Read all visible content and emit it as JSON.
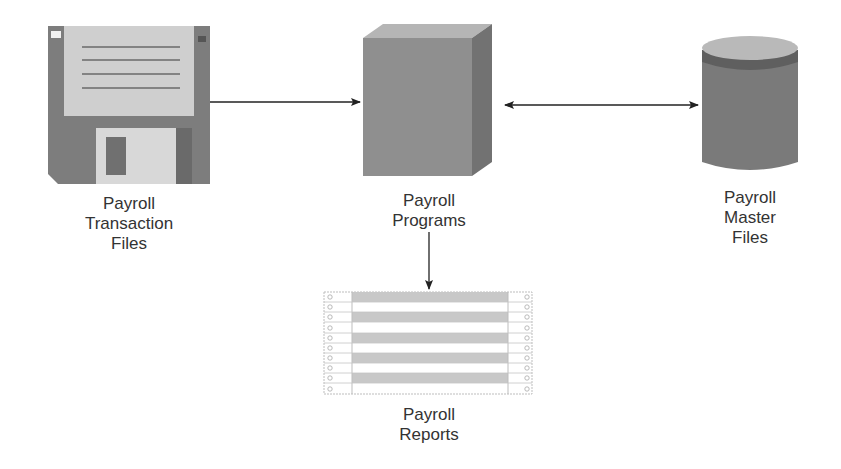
{
  "diagram": {
    "type": "data-flow",
    "nodes": [
      {
        "id": "transaction",
        "shape": "floppy-disk-icon",
        "label_lines": [
          "Payroll",
          "Transaction",
          "Files"
        ]
      },
      {
        "id": "programs",
        "shape": "cube-icon",
        "label_lines": [
          "Payroll",
          "Programs"
        ]
      },
      {
        "id": "master",
        "shape": "database-cylinder-icon",
        "label_lines": [
          "Payroll",
          "Master",
          "Files"
        ]
      },
      {
        "id": "reports",
        "shape": "printout-icon",
        "label_lines": [
          "Payroll",
          "Reports"
        ]
      }
    ],
    "edges": [
      {
        "from": "transaction",
        "to": "programs",
        "direction": "one-way"
      },
      {
        "from": "programs",
        "to": "master",
        "direction": "two-way"
      },
      {
        "from": "programs",
        "to": "reports",
        "direction": "one-way"
      }
    ]
  },
  "colors": {
    "floppy_body": "#7d7d7d",
    "floppy_label": "#cfcfcf",
    "floppy_shutter": "#d8d8d8",
    "cube_front": "#8f8f8f",
    "cube_side": "#727272",
    "cube_top": "#b5b5b5",
    "cylinder_body": "#7a7a7a",
    "cylinder_top": "#b9b9b9",
    "cylinder_band": "#5f5f5f",
    "report_stripe": "#c8c8c8",
    "arrow": "#222222",
    "text": "#333333"
  }
}
